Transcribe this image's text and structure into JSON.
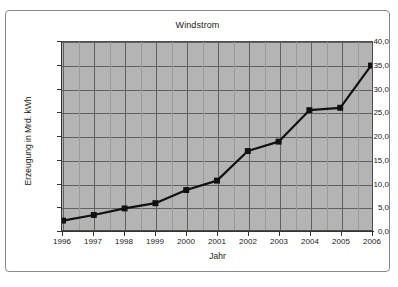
{
  "chart_data": {
    "type": "line",
    "title": "Windstrom",
    "xlabel": "Jahr",
    "ylabel": "Erzeugung in Mrd. kWh",
    "categories": [
      "1996",
      "1997",
      "1998",
      "1999",
      "2000",
      "2001",
      "2002",
      "2003",
      "2004",
      "2005",
      "2006"
    ],
    "x": [
      1996,
      1997,
      1998,
      1999,
      2000,
      2001,
      2002,
      2003,
      2004,
      2005,
      2006
    ],
    "values": [
      2.0,
      3.2,
      4.6,
      5.7,
      8.5,
      10.5,
      16.8,
      18.8,
      25.5,
      26.0,
      35.0
    ],
    "series": [
      {
        "name": "Windstrom",
        "values": [
          2.0,
          3.2,
          4.6,
          5.7,
          8.5,
          10.5,
          16.8,
          18.8,
          25.5,
          26.0,
          35.0
        ]
      }
    ],
    "ylim": [
      0,
      40
    ],
    "ytick_labels": [
      "0,0",
      "5,0",
      "10,0",
      "15,0",
      "20,0",
      "25,0",
      "30,0",
      "35,0",
      "40,0"
    ],
    "ytick_values": [
      0,
      5,
      10,
      15,
      20,
      25,
      30,
      35,
      40
    ],
    "xtick_labels": [
      "1996",
      "1997",
      "1998",
      "1999",
      "2000",
      "2001",
      "2002",
      "2003",
      "2004",
      "2005",
      "2006"
    ],
    "grid": true,
    "minor_vertical_gridlines": true,
    "legend": "none",
    "marker": "square",
    "colors": {
      "plot_background": "#b4b4b4",
      "gridline": "#616161",
      "minor_gridline": "#9a9a9a",
      "series_line": "#111111",
      "marker_fill": "#111111",
      "axis": "#333333",
      "frame_border": "#8a8a8a",
      "text": "#1a1a1a",
      "page_background": "#ffffff"
    }
  }
}
